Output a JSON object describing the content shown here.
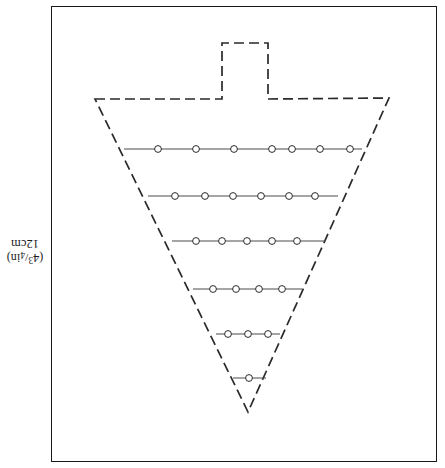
{
  "figure": {
    "caption": {
      "size_metric": "12cm",
      "size_imperial_open": "(4",
      "size_imperial_num": "3",
      "size_imperial_slash": "/",
      "size_imperial_den": "4",
      "size_imperial_close": "in)",
      "size_imperial_full": "(4 3/4 in)"
    },
    "colors": {
      "ink": "#1a1a1a",
      "outline": "#2a2a2a",
      "row_line": "#4a4a4a",
      "background": "#ffffff"
    },
    "plate": {
      "x": 51,
      "y": 6,
      "width": 386,
      "height": 456,
      "stroke_width": 1.6
    },
    "dash_pattern": "10 5",
    "outline": {
      "name": "cone-pattern-outline",
      "stroke_width": 1.7,
      "points": [
        [
          95,
          99
        ],
        [
          222,
          99
        ],
        [
          222,
          43
        ],
        [
          268,
          43
        ],
        [
          268,
          99
        ],
        [
          389,
          98
        ],
        [
          248,
          412
        ]
      ],
      "apex": [
        248,
        412
      ],
      "tab": {
        "left": 222,
        "right": 268,
        "top": 43,
        "bottom": 99
      }
    },
    "rows": [
      {
        "name": "stitch-row-1",
        "y": 149,
        "x_start": 124,
        "x_end": 362,
        "circle_count": 7,
        "circles_x": [
          158,
          196,
          234,
          272,
          292,
          320,
          350
        ]
      },
      {
        "name": "stitch-row-2",
        "y": 196,
        "x_start": 148,
        "x_end": 338,
        "circle_count": 6,
        "circles_x": [
          175,
          205,
          233,
          261,
          289,
          315
        ]
      },
      {
        "name": "stitch-row-3",
        "y": 241,
        "x_start": 172,
        "x_end": 325,
        "circle_count": 5,
        "circles_x": [
          196,
          222,
          247,
          272,
          297
        ]
      },
      {
        "name": "stitch-row-4",
        "y": 289,
        "x_start": 193,
        "x_end": 302,
        "circle_count": 4,
        "circles_x": [
          213,
          236,
          259,
          282
        ]
      },
      {
        "name": "stitch-row-5",
        "y": 334,
        "x_start": 216,
        "x_end": 280,
        "circle_count": 3,
        "circles_x": [
          228,
          248,
          268
        ]
      },
      {
        "name": "stitch-row-6",
        "y": 378,
        "x_start": 233,
        "x_end": 266,
        "circle_count": 1,
        "circles_x": [
          249
        ]
      }
    ],
    "circle": {
      "radius": 3.4,
      "stroke_width": 1.0,
      "fill": "#ffffff"
    }
  }
}
